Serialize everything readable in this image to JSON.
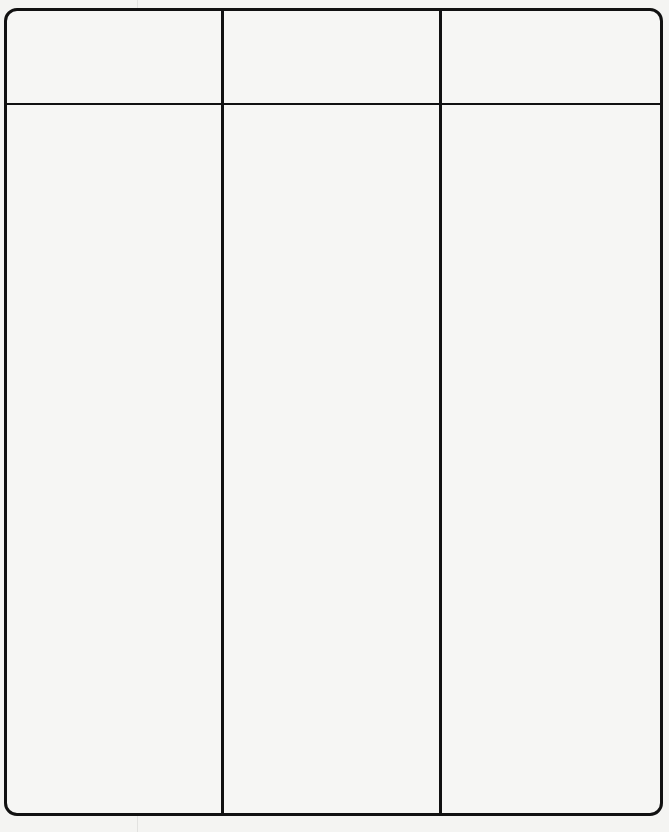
{
  "table": {
    "columns": [
      {
        "header": ""
      },
      {
        "header": ""
      },
      {
        "header": ""
      }
    ],
    "rows": [
      {
        "cells": [
          "",
          "",
          ""
        ]
      }
    ],
    "border_color": "#111111",
    "background": "#f6f6f4"
  }
}
